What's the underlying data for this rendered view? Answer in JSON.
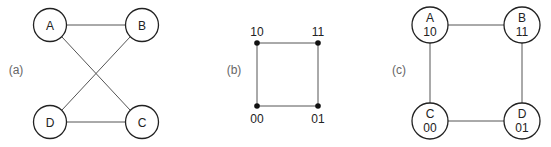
{
  "panels": [
    {
      "id": "a",
      "label": "(a)",
      "nodes": [
        {
          "name": "A",
          "x": 50,
          "y": 25
        },
        {
          "name": "B",
          "x": 142,
          "y": 25
        },
        {
          "name": "C",
          "x": 142,
          "y": 122
        },
        {
          "name": "D",
          "x": 50,
          "y": 122
        }
      ],
      "edges": [
        [
          "A",
          "B"
        ],
        [
          "A",
          "C"
        ],
        [
          "B",
          "D"
        ],
        [
          "D",
          "C"
        ]
      ]
    },
    {
      "id": "b",
      "label": "(b)",
      "vertices": [
        {
          "code": "10",
          "x": 257,
          "y": 43
        },
        {
          "code": "11",
          "x": 318,
          "y": 43
        },
        {
          "code": "00",
          "x": 257,
          "y": 106
        },
        {
          "code": "01",
          "x": 318,
          "y": 106
        }
      ],
      "edges": [
        [
          "10",
          "11"
        ],
        [
          "10",
          "00"
        ],
        [
          "11",
          "01"
        ],
        [
          "00",
          "01"
        ]
      ]
    },
    {
      "id": "c",
      "label": "(c)",
      "nodes": [
        {
          "name": "A",
          "code": "10",
          "x": 430,
          "y": 25
        },
        {
          "name": "B",
          "code": "11",
          "x": 522,
          "y": 25
        },
        {
          "name": "C",
          "code": "00",
          "x": 430,
          "y": 121
        },
        {
          "name": "D",
          "code": "01",
          "x": 522,
          "y": 121
        }
      ],
      "edges": [
        [
          "A",
          "B"
        ],
        [
          "A",
          "C"
        ],
        [
          "B",
          "D"
        ],
        [
          "C",
          "D"
        ]
      ]
    }
  ],
  "colors": {
    "edge": "#555555",
    "node_stroke": "#222222",
    "panel_label": "#666666"
  }
}
